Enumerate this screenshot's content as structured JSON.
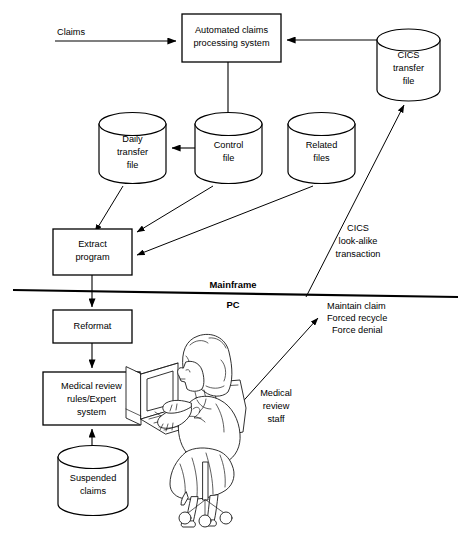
{
  "diagram": {
    "nodes": {
      "automated_claims": {
        "label_line1": "Automated claims",
        "label_line2": "processing system"
      },
      "cics_transfer_file": {
        "label_line1": "CICS",
        "label_line2": "transfer",
        "label_line3": "file"
      },
      "daily_transfer_file": {
        "label_line1": "Daily",
        "label_line2": "transfer",
        "label_line3": "file"
      },
      "control_file": {
        "label_line1": "Control",
        "label_line2": "file"
      },
      "related_files": {
        "label_line1": "Related",
        "label_line2": "files"
      },
      "extract_program": {
        "label_line1": "Extract",
        "label_line2": "program"
      },
      "reformat": {
        "label_line1": "Reformat"
      },
      "medical_review_rules": {
        "label_line1": "Medical review",
        "label_line2": "rules/Expert",
        "label_line3": "system"
      },
      "suspended_claims": {
        "label_line1": "Suspended",
        "label_line2": "claims"
      }
    },
    "labels": {
      "claims_input": "Claims",
      "cics_lookalike": {
        "line1": "CICS",
        "line2": "look-alike",
        "line3": "transaction"
      },
      "mainframe": "Mainframe",
      "pc": "PC",
      "actions": {
        "line1": "Maintain claim",
        "line2": "Forced recycle",
        "line3": "Force denial"
      },
      "medical_review_staff": {
        "line1": "Medical",
        "line2": "review",
        "line3": "staff"
      }
    },
    "colors": {
      "stroke": "#000000",
      "background": "#ffffff"
    }
  }
}
